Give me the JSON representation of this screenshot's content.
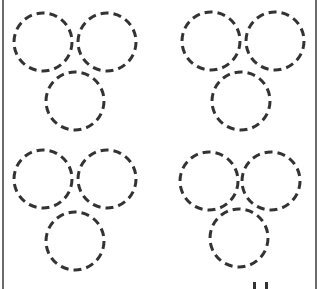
{
  "worksheet": {
    "stroke_color": "#333333",
    "border_color": "#6b6b6b",
    "circle_radius": 29,
    "groups": [
      {
        "name": "top-left",
        "circles": [
          {
            "cx": 43,
            "cy": 42
          },
          {
            "cx": 107,
            "cy": 42
          },
          {
            "cx": 75,
            "cy": 101
          }
        ]
      },
      {
        "name": "top-right",
        "circles": [
          {
            "cx": 211,
            "cy": 41
          },
          {
            "cx": 275,
            "cy": 41
          },
          {
            "cx": 241,
            "cy": 101
          }
        ]
      },
      {
        "name": "bottom-left",
        "circles": [
          {
            "cx": 43,
            "cy": 179
          },
          {
            "cx": 107,
            "cy": 179
          },
          {
            "cx": 75,
            "cy": 241
          }
        ]
      },
      {
        "name": "bottom-right",
        "circles": [
          {
            "cx": 209,
            "cy": 181
          },
          {
            "cx": 271,
            "cy": 181
          },
          {
            "cx": 239,
            "cy": 238
          }
        ]
      }
    ],
    "bottom_marks": [
      {
        "x": 253,
        "y": 282
      },
      {
        "x": 265,
        "y": 282
      }
    ]
  }
}
